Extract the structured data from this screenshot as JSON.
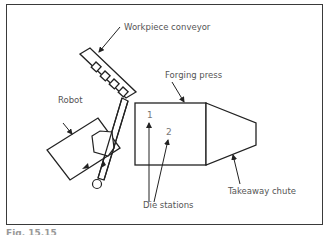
{
  "figure": {
    "labels": {
      "conveyor": "Workpiece conveyor",
      "press": "Forging press",
      "robot": "Robot",
      "chute": "Takeaway chute",
      "die_stations": "Die stations"
    },
    "station_numbers": [
      "1",
      "2"
    ],
    "caption": "Fig. 15.15"
  }
}
